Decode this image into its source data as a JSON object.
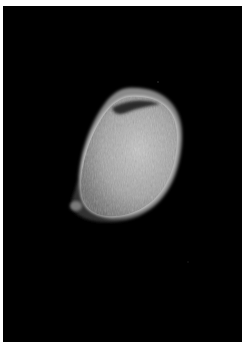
{
  "image": {
    "description": "Grayscale scan of a single oval, seed-like object on a black background with a white margin",
    "colors": {
      "margin": "#ffffff",
      "background": "#000000",
      "object_body": "#9a9a9a",
      "object_rim": "#d8d8d8",
      "object_shadow_cleft": "#2a2a2a"
    }
  }
}
